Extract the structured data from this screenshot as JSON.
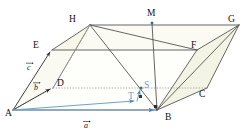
{
  "figure": {
    "kind": "parallelepiped-vector-diagram",
    "canvas": {
      "width": 249,
      "height": 132
    },
    "colors": {
      "background": "#ffffff",
      "edge": "#3f3f3f",
      "edge_light": "#6a6a6a",
      "face_fill": "#f7f7ec",
      "face_fill_strong": "#f2f2e2",
      "accent_blue": "#7aa9cf",
      "accent_blue_dark": "#5b8fb8",
      "label_text": "#111111",
      "dotted": "#8d8d8d"
    },
    "vertices": [
      {
        "id": "A",
        "label": "A",
        "x": 13,
        "y": 110,
        "label_x": 6,
        "label_y": 114,
        "color": "#111111"
      },
      {
        "id": "B",
        "label": "B",
        "x": 157,
        "y": 110,
        "label_x": 166,
        "label_y": 118,
        "color": "#111111"
      },
      {
        "id": "C",
        "label": "C",
        "x": 207,
        "y": 88,
        "label_x": 199,
        "label_y": 95,
        "color": "#111111"
      },
      {
        "id": "D",
        "label": "D",
        "x": 53,
        "y": 88,
        "label_x": 58,
        "label_y": 85,
        "color": "#111111"
      },
      {
        "id": "E",
        "label": "E",
        "x": 52,
        "y": 50,
        "label_x": 36,
        "label_y": 47,
        "color": "#111111"
      },
      {
        "id": "F",
        "label": "F",
        "x": 197,
        "y": 50,
        "label_x": 193,
        "label_y": 47,
        "color": "#111111"
      },
      {
        "id": "G",
        "label": "G",
        "x": 239,
        "y": 25,
        "label_x": 229,
        "label_y": 21,
        "color": "#111111"
      },
      {
        "id": "H",
        "label": "H",
        "x": 90,
        "y": 25,
        "label_x": 71,
        "label_y": 21,
        "color": "#111111"
      }
    ],
    "points": [
      {
        "id": "M",
        "label": "M",
        "x": 152,
        "y": 23,
        "label_x": 147,
        "label_y": 15,
        "color": "#111111",
        "marker": true
      },
      {
        "id": "S",
        "label": "S",
        "x": 141,
        "y": 88,
        "label_x": 144,
        "label_y": 87,
        "color": "#6f9fc8",
        "marker": true
      },
      {
        "id": "T",
        "label": "T",
        "x": 136,
        "y": 100,
        "label_x": 129,
        "label_y": 98,
        "color": "#6f9fc8",
        "marker": true
      }
    ],
    "vector_labels": [
      {
        "id": "a",
        "label": "a",
        "x": 84,
        "y": 127,
        "color": "#111111",
        "arrow": "over"
      },
      {
        "id": "b",
        "label": "b",
        "x": 35,
        "y": 89,
        "color": "#111111",
        "arrow": "over"
      },
      {
        "id": "c",
        "label": "c",
        "x": 28,
        "y": 69,
        "color": "#111111",
        "arrow": "over"
      }
    ],
    "vectors": [
      {
        "id": "vec-a",
        "from": "A",
        "to": "B",
        "color": "#7aa9cf",
        "label": "a"
      },
      {
        "id": "vec-b",
        "from": "A",
        "to": "D",
        "color": "#3f3f3f",
        "label": "b"
      },
      {
        "id": "vec-c",
        "from": "A",
        "to": "E",
        "color": "#3f3f3f",
        "label": "c"
      },
      {
        "id": "vec-at",
        "from": "A",
        "to": "T",
        "color": "#7aa9cf",
        "label": ""
      },
      {
        "id": "vec-ts",
        "from": "T",
        "to": "S",
        "color": "#7aa9cf",
        "label": ""
      }
    ],
    "edges": [
      {
        "from": "A",
        "to": "B",
        "style": "solid"
      },
      {
        "from": "B",
        "to": "C",
        "style": "solid"
      },
      {
        "from": "C",
        "to": "D",
        "style": "dotted"
      },
      {
        "from": "D",
        "to": "A",
        "style": "dotted"
      },
      {
        "from": "E",
        "to": "F",
        "style": "solid"
      },
      {
        "from": "F",
        "to": "G",
        "style": "solid"
      },
      {
        "from": "G",
        "to": "H",
        "style": "solid"
      },
      {
        "from": "H",
        "to": "E",
        "style": "solid"
      },
      {
        "from": "A",
        "to": "E",
        "style": "solid"
      },
      {
        "from": "B",
        "to": "F",
        "style": "solid"
      },
      {
        "from": "C",
        "to": "G",
        "style": "solid"
      },
      {
        "from": "D",
        "to": "H",
        "style": "solid"
      }
    ],
    "diagonals": [
      {
        "from": "H",
        "to": "B",
        "style": "solid"
      },
      {
        "from": "E",
        "to": "H",
        "style": "solid"
      },
      {
        "from": "H",
        "to": "F",
        "style": "solid"
      },
      {
        "from": "M",
        "to": "B",
        "style": "solid"
      },
      {
        "from": "B",
        "to": "G",
        "style": "solid"
      }
    ],
    "faces": [
      {
        "id": "face-adhe",
        "vertices": [
          "A",
          "D",
          "H",
          "E"
        ],
        "fill": "#f7f7ec"
      },
      {
        "id": "face-bcgf",
        "vertices": [
          "B",
          "C",
          "G",
          "F"
        ],
        "fill": "#f5f5e6"
      },
      {
        "id": "face-efgh",
        "vertices": [
          "E",
          "F",
          "G",
          "H"
        ],
        "fill": "#fafaf2"
      }
    ]
  }
}
